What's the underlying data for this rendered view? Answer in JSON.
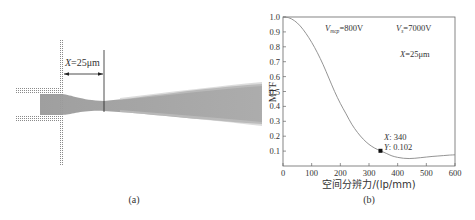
{
  "figure": {
    "panel_a": {
      "caption": "(a)",
      "label_var": "X",
      "label_rest": "=25μm",
      "beam_color": "#9a9a9a",
      "grid_color": "#8a8a8a"
    },
    "panel_b": {
      "caption": "(b)"
    }
  },
  "chart_data": {
    "type": "line",
    "title": "",
    "xlabel": "空间分辨力/(lp/mm)",
    "ylabel": "MTF",
    "xlim": [
      0,
      600
    ],
    "ylim": [
      0,
      1.0
    ],
    "grid": false,
    "x_ticks": [
      "0",
      "100",
      "200",
      "300",
      "400",
      "500",
      "600"
    ],
    "y_ticks": [
      "0.1",
      "0.2",
      "0.3",
      "0.4",
      "0.5",
      "0.6",
      "0.7",
      "0.8",
      "0.9",
      "1.0"
    ],
    "annotations": {
      "vmcp": {
        "var": "V",
        "sub": "mcp",
        "rest": "=800V"
      },
      "vs": {
        "var": "V",
        "sub": "s",
        "rest": "=7000V"
      },
      "x_dist": {
        "var": "X",
        "rest": "=25μm"
      },
      "datatip": {
        "x_label": "X",
        "x_value": "340",
        "y_label": "Y",
        "y_value": "0.102"
      }
    },
    "series": [
      {
        "name": "MTF",
        "color": "#888888",
        "x": [
          0,
          20,
          40,
          60,
          80,
          100,
          120,
          140,
          160,
          180,
          200,
          220,
          240,
          260,
          280,
          300,
          320,
          340,
          360,
          380,
          400,
          420,
          440,
          460,
          480,
          500,
          520,
          540,
          560,
          580,
          600
        ],
        "y": [
          1.0,
          0.995,
          0.975,
          0.94,
          0.89,
          0.83,
          0.76,
          0.68,
          0.59,
          0.5,
          0.42,
          0.35,
          0.28,
          0.225,
          0.18,
          0.145,
          0.12,
          0.102,
          0.085,
          0.068,
          0.058,
          0.052,
          0.05,
          0.052,
          0.056,
          0.06,
          0.064,
          0.067,
          0.07,
          0.073,
          0.075
        ]
      }
    ],
    "highlight_point": {
      "x": 340,
      "y": 0.102
    }
  }
}
